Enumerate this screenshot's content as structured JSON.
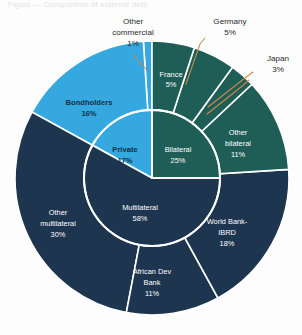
{
  "figure": {
    "faint_header_text": "Figure — Composition of external debt",
    "background_color": "#fdfdfd",
    "leader_line_color": "#c98a4b"
  },
  "palette": {
    "private_light_blue": "#35a8e0",
    "bilateral_teal": "#1f5e56",
    "multilateral_navy": "#1e3550",
    "separator_white": "#ffffff",
    "outer_label_text": "#2b2b2b",
    "inner_label_text": "#ffffff"
  },
  "chart_data": {
    "type": "pie",
    "title": "",
    "subtitle": "",
    "xlabel": "",
    "ylabel": "",
    "legend_position": "none",
    "grid": false,
    "units": "percent",
    "note": "Nested (two-ring) pie chart. Inner ring = creditor category totals; outer ring = individual creditors summing to each category.",
    "inner_ring": {
      "name": "Creditor category",
      "categories": [
        "Private",
        "Bilateral",
        "Multilateral"
      ],
      "values": [
        17,
        25,
        58
      ],
      "colors": [
        "#35a8e0",
        "#1f5e56",
        "#1e3550"
      ],
      "labels": [
        {
          "name": "Private",
          "value": 17,
          "display": "17%",
          "color": "#35a8e0"
        },
        {
          "name": "Bilateral",
          "value": 25,
          "display": "25%",
          "color": "#1f5e56"
        },
        {
          "name": "Multilateral",
          "value": 58,
          "display": "58%",
          "color": "#1e3550"
        }
      ]
    },
    "outer_ring": {
      "name": "Individual creditor",
      "categories": [
        "Bondholders",
        "Other commercial",
        "France",
        "Germany",
        "Japan",
        "Other bilateral",
        "World Bank-IBRD",
        "African Dev Bank",
        "Other multilateral"
      ],
      "values": [
        16,
        1,
        5,
        5,
        3,
        11,
        18,
        11,
        30
      ],
      "parents": [
        "Private",
        "Private",
        "Bilateral",
        "Bilateral",
        "Bilateral",
        "Bilateral",
        "Multilateral",
        "Multilateral",
        "Multilateral"
      ],
      "colors": [
        "#35a8e0",
        "#35a8e0",
        "#1f5e56",
        "#1f5e56",
        "#1f5e56",
        "#1f5e56",
        "#1e3550",
        "#1e3550",
        "#1e3550"
      ],
      "labels": [
        {
          "name": "Bondholders",
          "value": 16,
          "display": "16%",
          "placement": "inside"
        },
        {
          "name": "Other commercial",
          "value": 1,
          "display": "1%",
          "placement": "callout"
        },
        {
          "name": "France",
          "value": 5,
          "display": "5%",
          "placement": "inside"
        },
        {
          "name": "Germany",
          "value": 5,
          "display": "5%",
          "placement": "callout"
        },
        {
          "name": "Japan",
          "value": 3,
          "display": "3%",
          "placement": "callout"
        },
        {
          "name": "Other bilateral",
          "value": 11,
          "display": "11%",
          "placement": "inside"
        },
        {
          "name": "World Bank-IBRD",
          "value": 18,
          "display": "18%",
          "placement": "inside"
        },
        {
          "name": "African Dev Bank",
          "value": 11,
          "display": "11%",
          "placement": "inside"
        },
        {
          "name": "Other multilateral",
          "value": 30,
          "display": "30%",
          "placement": "inside"
        }
      ]
    }
  },
  "labels": {
    "other_commercial": {
      "line1": "Other",
      "line2": "commercial",
      "line3": "1%"
    },
    "germany": {
      "line1": "Germany",
      "line2": "5%"
    },
    "japan": {
      "line1": "Japan",
      "line2": "3%"
    },
    "france": {
      "line1": "France",
      "line2": "5%"
    },
    "bondholders": {
      "line1": "Bondholders",
      "line2": "16%"
    },
    "other_bilateral": {
      "line1": "Other",
      "line2": "bilateral",
      "line3": "11%"
    },
    "private": {
      "line1": "Private",
      "line2": "17%"
    },
    "bilateral": {
      "line1": "Bilateral",
      "line2": "25%"
    },
    "multilateral": {
      "line1": "Multilateral",
      "line2": "58%"
    },
    "other_multilateral": {
      "line1": "Other",
      "line2": "multilateral",
      "line3": "30%"
    },
    "world_bank": {
      "line1": "World Bank-",
      "line2": "IBRD",
      "line3": "18%"
    },
    "african_dev_bank": {
      "line1": "African Dev",
      "line2": "Bank",
      "line3": "11%"
    }
  }
}
